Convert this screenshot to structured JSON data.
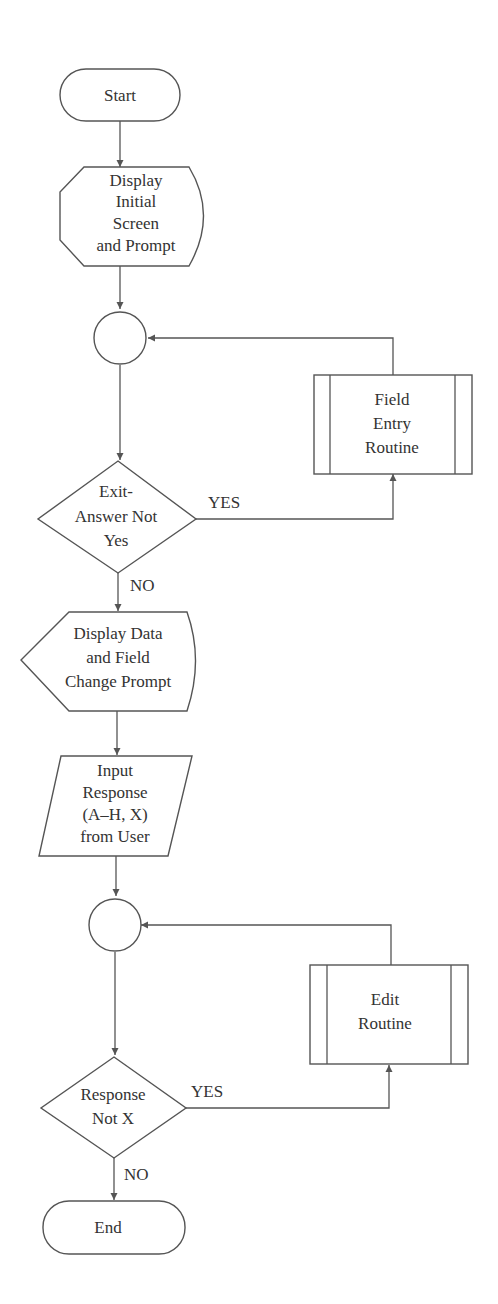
{
  "diagram": {
    "type": "flowchart",
    "nodes": {
      "start": {
        "shape": "terminator",
        "label": "Start"
      },
      "display_initial": {
        "shape": "display",
        "lines": [
          "Display",
          "Initial",
          "Screen",
          "and Prompt"
        ]
      },
      "connector1": {
        "shape": "connector",
        "label": ""
      },
      "field_entry": {
        "shape": "predefined-process",
        "lines": [
          "Field",
          "Entry",
          "Routine"
        ]
      },
      "exit_decision": {
        "shape": "decision",
        "lines": [
          "Exit-",
          "Answer Not",
          "Yes"
        ]
      },
      "display_data": {
        "shape": "display",
        "lines": [
          "Display Data",
          "and Field",
          "Change Prompt"
        ]
      },
      "input_response": {
        "shape": "input-output",
        "lines": [
          "Input",
          "Response",
          "(A–H, X)",
          "from User"
        ]
      },
      "connector2": {
        "shape": "connector",
        "label": ""
      },
      "edit_routine": {
        "shape": "predefined-process",
        "lines": [
          "Edit",
          "Routine"
        ]
      },
      "response_decision": {
        "shape": "decision",
        "lines": [
          "Response",
          "Not X"
        ]
      },
      "end": {
        "shape": "terminator",
        "label": "End"
      }
    },
    "edges": [
      {
        "from": "start",
        "to": "display_initial",
        "label": ""
      },
      {
        "from": "display_initial",
        "to": "connector1",
        "label": ""
      },
      {
        "from": "connector1",
        "to": "exit_decision",
        "label": ""
      },
      {
        "from": "exit_decision",
        "to": "field_entry",
        "label": "YES"
      },
      {
        "from": "field_entry",
        "to": "connector1",
        "label": ""
      },
      {
        "from": "exit_decision",
        "to": "display_data",
        "label": "NO"
      },
      {
        "from": "display_data",
        "to": "input_response",
        "label": ""
      },
      {
        "from": "input_response",
        "to": "connector2",
        "label": ""
      },
      {
        "from": "connector2",
        "to": "response_decision",
        "label": ""
      },
      {
        "from": "response_decision",
        "to": "edit_routine",
        "label": "YES"
      },
      {
        "from": "edit_routine",
        "to": "connector2",
        "label": ""
      },
      {
        "from": "response_decision",
        "to": "end",
        "label": "NO"
      }
    ],
    "edge_labels": {
      "exit_yes": "YES",
      "exit_no": "NO",
      "response_yes": "YES",
      "response_no": "NO"
    }
  }
}
